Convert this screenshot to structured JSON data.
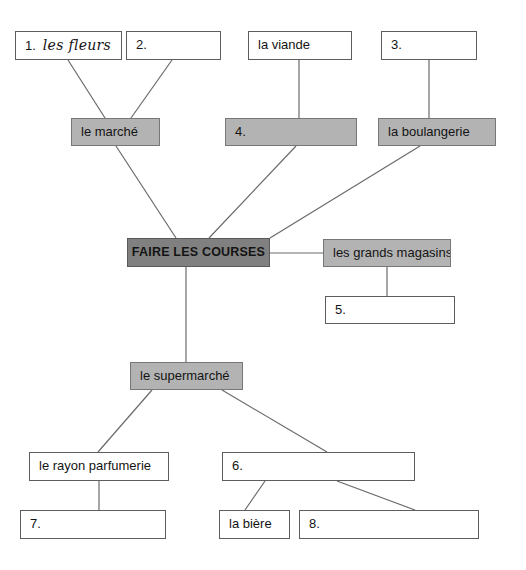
{
  "diagram": {
    "colors": {
      "center_fill": "#808080",
      "branch_fill": "#b3b3b3",
      "blank_fill": "#ffffff",
      "border": "#5d5d5d",
      "line": "#6a6a6a",
      "text": "#141414"
    },
    "nodes": [
      {
        "id": "n1",
        "name": "node-fleurs",
        "number": "1.",
        "answer": "les fleurs",
        "answer_style": "handwritten",
        "label": "1. les fleurs",
        "style": "blank",
        "x": 15,
        "y": 31,
        "w": 107,
        "h": 29
      },
      {
        "id": "n2",
        "name": "node-blank-2",
        "number": "2.",
        "answer": "",
        "label": "2.",
        "style": "blank",
        "x": 126,
        "y": 31,
        "w": 95,
        "h": 29
      },
      {
        "id": "n3",
        "name": "node-la-viande",
        "number": "",
        "answer": "",
        "label": "la viande",
        "style": "blank",
        "x": 248,
        "y": 31,
        "w": 104,
        "h": 29
      },
      {
        "id": "n4",
        "name": "node-blank-3",
        "number": "3.",
        "answer": "",
        "label": "3.",
        "style": "blank",
        "x": 381,
        "y": 31,
        "w": 96,
        "h": 29
      },
      {
        "id": "n5",
        "name": "node-le-marche",
        "number": "",
        "answer": "",
        "label": "le marché",
        "style": "filled-light",
        "x": 71,
        "y": 118,
        "w": 89,
        "h": 28
      },
      {
        "id": "n6",
        "name": "node-blank-4",
        "number": "4.",
        "answer": "",
        "label": "4.",
        "style": "filled-light",
        "x": 225,
        "y": 118,
        "w": 132,
        "h": 28
      },
      {
        "id": "n7",
        "name": "node-la-boulangerie",
        "number": "",
        "answer": "",
        "label": "la boulangerie",
        "style": "filled-light",
        "x": 378,
        "y": 118,
        "w": 118,
        "h": 28
      },
      {
        "id": "n8",
        "name": "node-faire-les-courses",
        "number": "",
        "answer": "",
        "label": "FAIRE LES COURSES",
        "style": "filled-dark",
        "x": 127,
        "y": 238,
        "w": 143,
        "h": 29
      },
      {
        "id": "n9",
        "name": "node-les-grands-magasins",
        "number": "",
        "answer": "",
        "label": "les grands magasins",
        "style": "filled-light",
        "x": 323,
        "y": 239,
        "w": 128,
        "h": 28
      },
      {
        "id": "n10",
        "name": "node-blank-5",
        "number": "5.",
        "answer": "",
        "label": "5.",
        "style": "blank",
        "x": 325,
        "y": 296,
        "w": 130,
        "h": 28
      },
      {
        "id": "n11",
        "name": "node-le-supermarche",
        "number": "",
        "answer": "",
        "label": "le supermarché",
        "style": "filled-light",
        "x": 130,
        "y": 362,
        "w": 113,
        "h": 28
      },
      {
        "id": "n12",
        "name": "node-le-rayon-parfumerie",
        "number": "",
        "answer": "",
        "label": "le rayon parfumerie",
        "style": "blank",
        "x": 29,
        "y": 452,
        "w": 140,
        "h": 29
      },
      {
        "id": "n13",
        "name": "node-blank-6",
        "number": "6.",
        "answer": "",
        "label": "6.",
        "style": "blank",
        "x": 222,
        "y": 452,
        "w": 193,
        "h": 29
      },
      {
        "id": "n14",
        "name": "node-blank-7",
        "number": "7.",
        "answer": "",
        "label": "7.",
        "style": "blank",
        "x": 20,
        "y": 510,
        "w": 146,
        "h": 29
      },
      {
        "id": "n15",
        "name": "node-la-biere",
        "number": "",
        "answer": "",
        "label": "la bière",
        "style": "blank",
        "x": 219,
        "y": 510,
        "w": 71,
        "h": 29
      },
      {
        "id": "n16",
        "name": "node-blank-8",
        "number": "8.",
        "answer": "",
        "label": "8.",
        "style": "blank",
        "x": 299,
        "y": 510,
        "w": 180,
        "h": 29
      }
    ],
    "edges": [
      {
        "name": "edge-fleurs-to-marche",
        "from": "n1",
        "to": "n5",
        "x1": 68,
        "y1": 60,
        "x2": 105,
        "y2": 118
      },
      {
        "name": "edge-blank2-to-marche",
        "from": "n2",
        "to": "n5",
        "x1": 172,
        "y1": 60,
        "x2": 131,
        "y2": 118
      },
      {
        "name": "edge-viande-to-blank4",
        "from": "n3",
        "to": "n6",
        "x1": 299,
        "y1": 60,
        "x2": 299,
        "y2": 118
      },
      {
        "name": "edge-blank3-to-boulangerie",
        "from": "n4",
        "to": "n7",
        "x1": 429,
        "y1": 60,
        "x2": 429,
        "y2": 118
      },
      {
        "name": "edge-marche-to-center",
        "from": "n5",
        "to": "n8",
        "x1": 116,
        "y1": 146,
        "x2": 176,
        "y2": 238
      },
      {
        "name": "edge-blank4-to-center",
        "from": "n6",
        "to": "n8",
        "x1": 296,
        "y1": 146,
        "x2": 209,
        "y2": 238
      },
      {
        "name": "edge-boulangerie-to-center",
        "from": "n7",
        "to": "n8",
        "x1": 420,
        "y1": 146,
        "x2": 270,
        "y2": 238
      },
      {
        "name": "edge-center-to-grands-magasins",
        "from": "n8",
        "to": "n9",
        "x1": 270,
        "y1": 253,
        "x2": 323,
        "y2": 253
      },
      {
        "name": "edge-grands-magasins-to-blank5",
        "from": "n9",
        "to": "n10",
        "x1": 387,
        "y1": 267,
        "x2": 387,
        "y2": 296
      },
      {
        "name": "edge-center-to-supermarche",
        "from": "n8",
        "to": "n11",
        "x1": 186,
        "y1": 267,
        "x2": 186,
        "y2": 362
      },
      {
        "name": "edge-supermarche-to-parfumerie",
        "from": "n11",
        "to": "n12",
        "x1": 152,
        "y1": 390,
        "x2": 98,
        "y2": 452
      },
      {
        "name": "edge-supermarche-to-blank6",
        "from": "n11",
        "to": "n13",
        "x1": 222,
        "y1": 390,
        "x2": 327,
        "y2": 452
      },
      {
        "name": "edge-parfumerie-to-blank7",
        "from": "n12",
        "to": "n14",
        "x1": 99,
        "y1": 481,
        "x2": 99,
        "y2": 510
      },
      {
        "name": "edge-blank6-to-biere",
        "from": "n13",
        "to": "n15",
        "x1": 265,
        "y1": 481,
        "x2": 245,
        "y2": 510
      },
      {
        "name": "edge-blank6-to-blank8",
        "from": "n13",
        "to": "n16",
        "x1": 337,
        "y1": 481,
        "x2": 415,
        "y2": 510
      }
    ]
  }
}
